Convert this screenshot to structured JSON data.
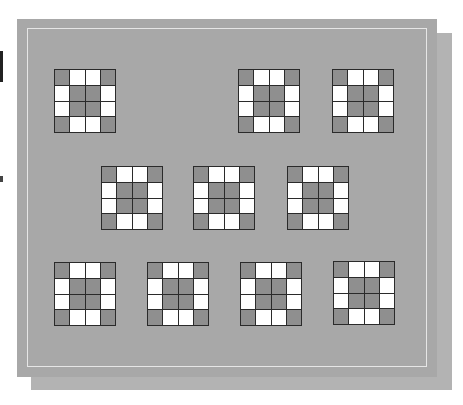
{
  "figure": {
    "colors": {
      "panel": "#a8a8a8",
      "shadow_panel": "#b3b3b3",
      "inner_frame": "#e6e6e6",
      "dark_cell": "#8f8f8f",
      "light_cell": "#ffffff",
      "grid_line": "#2a2a2a"
    },
    "pattern": [
      [
        1,
        0,
        0,
        1
      ],
      [
        0,
        1,
        1,
        0
      ],
      [
        0,
        1,
        1,
        0
      ],
      [
        1,
        0,
        0,
        1
      ]
    ],
    "grids": [
      {
        "row": 1,
        "x": 37,
        "y": 50
      },
      {
        "row": 1,
        "x": 221,
        "y": 50
      },
      {
        "row": 1,
        "x": 315,
        "y": 50
      },
      {
        "row": 2,
        "x": 84,
        "y": 147
      },
      {
        "row": 2,
        "x": 176,
        "y": 147
      },
      {
        "row": 2,
        "x": 270,
        "y": 147
      },
      {
        "row": 3,
        "x": 37,
        "y": 243
      },
      {
        "row": 3,
        "x": 130,
        "y": 243
      },
      {
        "row": 3,
        "x": 223,
        "y": 243
      },
      {
        "row": 3,
        "x": 316,
        "y": 242
      }
    ]
  }
}
